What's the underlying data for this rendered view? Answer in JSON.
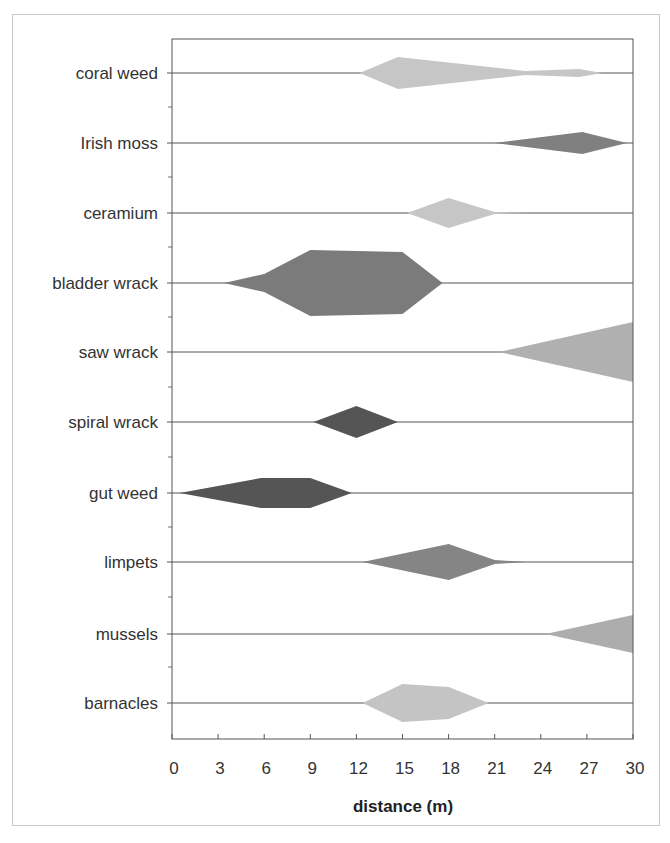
{
  "chart_data": {
    "type": "kite",
    "title": "",
    "xlabel": "distance (m)",
    "ylabel": "",
    "xlim": [
      0,
      30
    ],
    "xticks": [
      0,
      3,
      6,
      9,
      12,
      15,
      18,
      21,
      24,
      27,
      30
    ],
    "grid": false,
    "legend": "none",
    "note": "Kite diagram: each species row shows abundance (kite half-width, px-scale) along a transect distance in metres; top/bottom half-widths listed where asymmetric.",
    "series": [
      {
        "name": "coral weed",
        "color": "#c6c6c6",
        "points": [
          [
            12.2,
            0
          ],
          [
            14.7,
            16
          ],
          [
            23,
            2
          ],
          [
            26.5,
            4
          ],
          [
            28,
            0
          ]
        ]
      },
      {
        "name": "Irish moss",
        "color": "#808080",
        "points": [
          [
            21,
            0
          ],
          [
            26.7,
            11
          ],
          [
            29.6,
            0
          ]
        ]
      },
      {
        "name": "ceramium",
        "color": "#c6c6c6",
        "points": [
          [
            15.3,
            0
          ],
          [
            18,
            15
          ],
          [
            21,
            1
          ],
          [
            23,
            0
          ]
        ]
      },
      {
        "name": "bladder wrack",
        "color": "#7b7b7b",
        "points": [
          [
            3.4,
            0
          ],
          [
            6,
            9
          ],
          [
            9,
            33
          ],
          [
            15,
            31
          ],
          [
            17.6,
            0
          ]
        ]
      },
      {
        "name": "saw wrack",
        "color": "#b0b0b0",
        "points": [
          [
            21.3,
            0
          ],
          [
            30,
            30
          ]
        ]
      },
      {
        "name": "spiral wrack",
        "color": "#555555",
        "points": [
          [
            9.2,
            0
          ],
          [
            12,
            16
          ],
          [
            14.7,
            0
          ]
        ]
      },
      {
        "name": "gut weed",
        "color": "#555555",
        "points": [
          [
            0.5,
            0
          ],
          [
            5.8,
            15
          ],
          [
            9,
            15
          ],
          [
            11.7,
            0
          ]
        ]
      },
      {
        "name": "limpets",
        "color": "#858585",
        "points": [
          [
            12.4,
            0
          ],
          [
            18,
            18
          ],
          [
            21,
            2
          ],
          [
            23,
            0
          ]
        ]
      },
      {
        "name": "mussels",
        "color": "#adadad",
        "points": [
          [
            24.3,
            0
          ],
          [
            30,
            19
          ]
        ]
      },
      {
        "name": "barnacles",
        "color": "#c4c4c4",
        "points": [
          [
            12.4,
            0
          ],
          [
            15,
            19
          ],
          [
            18,
            16
          ],
          [
            20.6,
            0
          ]
        ]
      }
    ]
  },
  "layout": {
    "plot": {
      "left": 172,
      "right": 633,
      "top": 39,
      "bottom": 739
    },
    "row_centers": [
      73,
      143,
      213,
      283,
      352,
      422,
      493,
      562,
      634,
      703
    ],
    "minor_ticks": [
      107,
      177,
      247,
      317,
      387,
      457,
      527,
      597,
      667
    ]
  }
}
